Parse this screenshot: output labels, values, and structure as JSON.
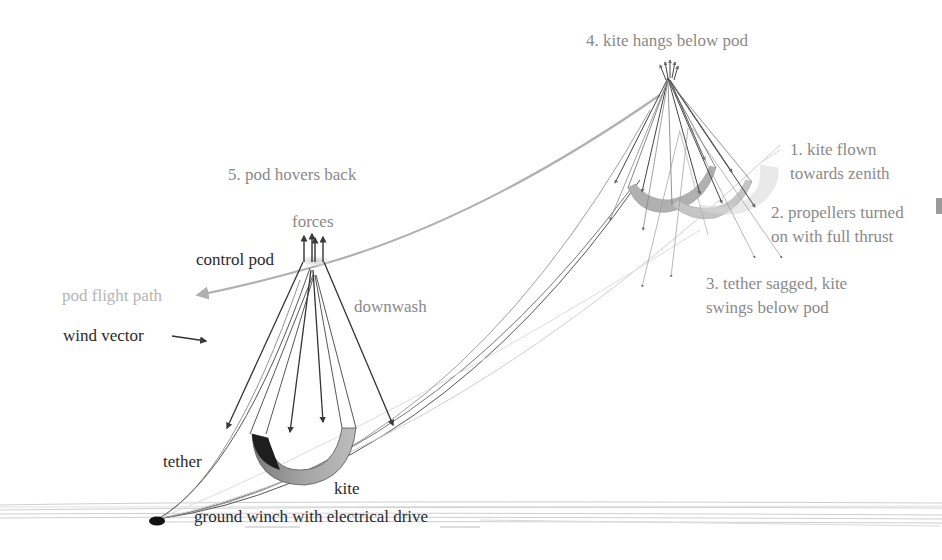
{
  "diagram": {
    "type": "airborne wind energy pumping cycle with hovering control pod",
    "labels": {
      "step4": "4. kite hangs below pod",
      "step1_line1": "1. kite flown",
      "step1_line2": "towards zenith",
      "step2_line1": "2. propellers turned",
      "step2_line2": "on with full thrust",
      "step3_line1": "3. tether sagged, kite",
      "step3_line2": "swings below pod",
      "step5": "5. pod hovers back",
      "forces": "forces",
      "control_pod": "control pod",
      "downwash": "downwash",
      "pod_flight_path": "pod flight path",
      "wind_vector": "wind vector",
      "tether": "tether",
      "kite": "kite",
      "ground_winch": "ground winch with electrical drive"
    },
    "colors": {
      "text_dark": "#2a2a2a",
      "text_grey": "#8a8a8a",
      "text_light": "#b5b5b5",
      "arrow_dark": "#444444",
      "flight_path": "#b0b0b0",
      "kite_grey": "#a8a8a8",
      "kite_dark": "#1e1e1e",
      "ground": "#cfcfcf"
    }
  }
}
